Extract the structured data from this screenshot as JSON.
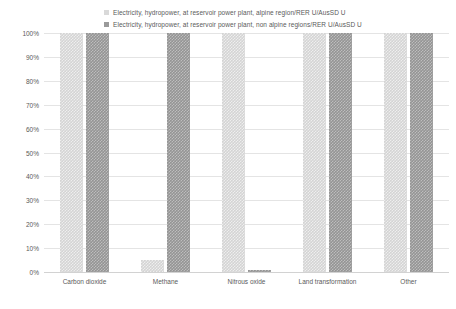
{
  "chart_data": {
    "type": "bar",
    "title": "",
    "subtitle": "",
    "xlabel": "",
    "ylabel": "",
    "ylim": [
      0,
      100
    ],
    "ytick_labels": [
      "100%",
      "90%",
      "80%",
      "70%",
      "60%",
      "50%",
      "40%",
      "30%",
      "20%",
      "10%",
      "0%"
    ],
    "ytick_values": [
      100,
      90,
      80,
      70,
      60,
      50,
      40,
      30,
      20,
      10,
      0
    ],
    "grid": true,
    "legend_position": "top",
    "stacked": false,
    "categories": [
      "Carbon dioxide",
      "Methane",
      "Nitrous oxide",
      "Land transformation",
      "Other"
    ],
    "series": [
      {
        "name": "Electricity, hydropower, at reservoir power plant, alpine region/RER U/AusSD U",
        "color": "#d4d4d4",
        "values": [
          100,
          5,
          100,
          100,
          100
        ]
      },
      {
        "name": "Electricity, hydropower, at reservoir power plant, non alpine regions/RER U/AusSD U",
        "color": "#949494",
        "values": [
          100,
          100,
          1,
          100,
          100
        ]
      }
    ]
  },
  "legend": {
    "items": [
      {
        "label": "Electricity, hydropower, at reservoir power plant, alpine region/RER U/AusSD U",
        "swatch": "light"
      },
      {
        "label": "Electricity, hydropower, at reservoir power plant, non alpine regions/RER U/AusSD U",
        "swatch": "dark"
      }
    ]
  }
}
